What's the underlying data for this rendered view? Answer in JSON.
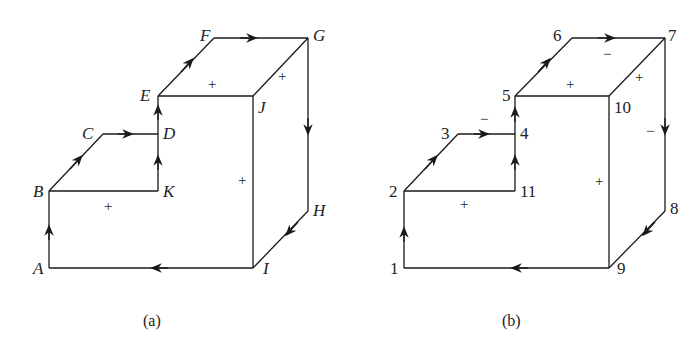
{
  "figures": [
    {
      "id": "a",
      "caption": "(a)",
      "nodes": {
        "A": "A",
        "B": "B",
        "C": "C",
        "D": "D",
        "E": "E",
        "F": "F",
        "G": "G",
        "H": "H",
        "I": "I",
        "J": "J",
        "K": "K"
      },
      "signs": {
        "top_face": "+",
        "right_top_edge": "+",
        "front_face": "+",
        "step_face": "+"
      }
    },
    {
      "id": "b",
      "caption": "(b)",
      "nodes": {
        "n1": "1",
        "n2": "2",
        "n3": "3",
        "n4": "4",
        "n5": "5",
        "n6": "6",
        "n7": "7",
        "n8": "8",
        "n9": "9",
        "n10": "10",
        "n11": "11"
      },
      "signs": {
        "top_face_plus": "+",
        "top_face_minus": "−",
        "right_top_edge": "+",
        "right_side_minus": "−",
        "step_top_minus": "−",
        "front_face": "+",
        "step_face": "+"
      }
    }
  ]
}
